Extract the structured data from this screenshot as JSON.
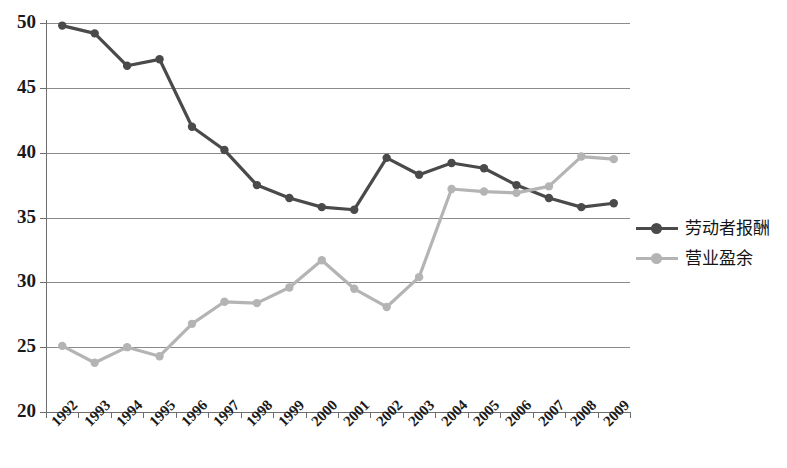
{
  "chart_data": {
    "type": "line",
    "title": "",
    "subtitle": "",
    "xlabel": "",
    "ylabel": "",
    "grid": true,
    "legend_position": "right",
    "ylim": [
      20,
      50
    ],
    "yticks": [
      20,
      25,
      30,
      35,
      40,
      45,
      50
    ],
    "ytick_labels": [
      "20",
      "25",
      "30",
      "35",
      "40",
      "45",
      "50"
    ],
    "categories": [
      "1992",
      "1993",
      "1994",
      "1995",
      "1996",
      "1997",
      "1998",
      "1999",
      "2000",
      "2001",
      "2002",
      "2003",
      "2004",
      "2005",
      "2006",
      "2007",
      "2008",
      "2009"
    ],
    "x": [
      1992,
      1993,
      1994,
      1995,
      1996,
      1997,
      1998,
      1999,
      2000,
      2001,
      2002,
      2003,
      2004,
      2005,
      2006,
      2007,
      2008,
      2009
    ],
    "series": [
      {
        "name": "劳动者报酬",
        "color": "#4a4a4a",
        "marker": "circle",
        "values": [
          49.8,
          49.2,
          46.7,
          47.2,
          42.0,
          40.2,
          37.5,
          36.5,
          35.8,
          35.6,
          39.6,
          38.3,
          39.2,
          38.8,
          37.5,
          36.5,
          35.8,
          36.1
        ]
      },
      {
        "name": "营业盈余",
        "color": "#b4b4b4",
        "marker": "circle",
        "values": [
          25.1,
          23.8,
          25.0,
          24.3,
          26.8,
          28.5,
          28.4,
          29.6,
          31.7,
          29.5,
          28.1,
          30.4,
          37.2,
          37.0,
          36.9,
          37.4,
          39.7,
          39.5
        ]
      }
    ]
  },
  "legend": {
    "items": [
      {
        "label": "劳动者报酬",
        "color": "#4a4a4a"
      },
      {
        "label": "营业盈余",
        "color": "#b4b4b4"
      }
    ]
  },
  "colors": {
    "series_labor": "#4a4a4a",
    "series_surplus": "#b4b4b4",
    "gridline": "#8b8b8b",
    "axis": "#6e6e6e",
    "text": "#1a1a1a",
    "background": "#ffffff"
  }
}
